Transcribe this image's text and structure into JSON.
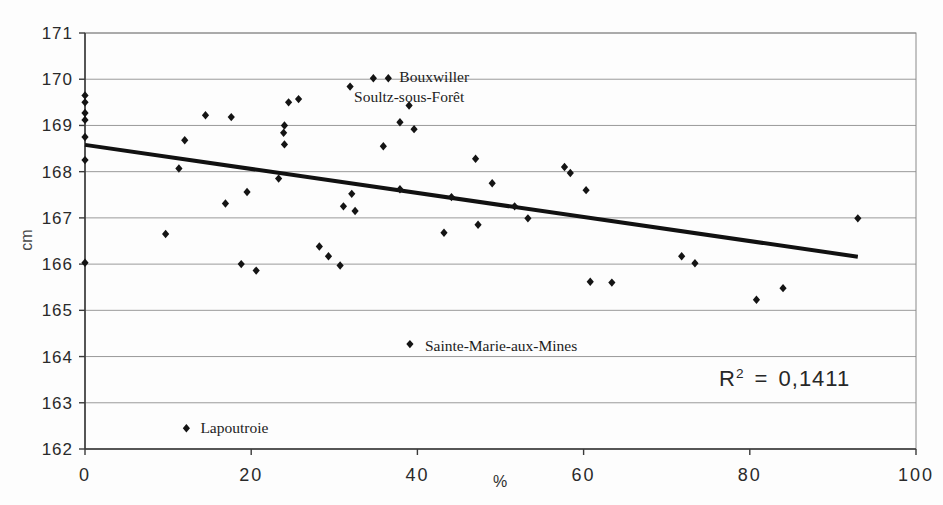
{
  "chart_data": {
    "type": "scatter",
    "title": "",
    "xlabel": "%",
    "ylabel": "cm",
    "xlim": [
      0,
      100
    ],
    "ylim": [
      162,
      171
    ],
    "x_ticks": [
      0,
      20,
      40,
      60,
      80,
      100
    ],
    "y_ticks": [
      162,
      163,
      164,
      165,
      166,
      167,
      168,
      169,
      170,
      171
    ],
    "grid": "horizontal",
    "legend": "none",
    "marker": "diamond",
    "colors": {
      "marker": "#141414",
      "trendline": "#111111",
      "gridline": "#9a9a9a",
      "border": "#8a8a8a",
      "axis": "#3a3a3a",
      "tick_text": "#2a2a2a",
      "annotation_text": "#1c1c1c"
    },
    "points": [
      [
        0,
        169.65
      ],
      [
        0,
        169.5
      ],
      [
        0,
        169.27
      ],
      [
        0,
        169.12
      ],
      [
        0,
        168.75
      ],
      [
        0,
        168.25
      ],
      [
        0,
        166.03
      ],
      [
        9.7,
        166.65
      ],
      [
        11.3,
        168.07
      ],
      [
        12.0,
        168.68
      ],
      [
        12.2,
        162.45
      ],
      [
        14.5,
        169.22
      ],
      [
        16.9,
        167.31
      ],
      [
        17.6,
        169.18
      ],
      [
        18.8,
        166.0
      ],
      [
        19.5,
        167.56
      ],
      [
        20.6,
        165.86
      ],
      [
        23.3,
        167.85
      ],
      [
        23.9,
        168.84
      ],
      [
        24.0,
        169.0
      ],
      [
        24.0,
        168.59
      ],
      [
        24.5,
        169.5
      ],
      [
        25.7,
        169.57
      ],
      [
        28.2,
        166.38
      ],
      [
        29.3,
        166.17
      ],
      [
        30.7,
        165.97
      ],
      [
        31.1,
        167.25
      ],
      [
        31.9,
        169.84
      ],
      [
        32.1,
        167.52
      ],
      [
        32.5,
        167.15
      ],
      [
        34.7,
        170.02
      ],
      [
        35.9,
        168.55
      ],
      [
        36.5,
        170.02
      ],
      [
        37.9,
        169.07
      ],
      [
        37.9,
        167.62
      ],
      [
        39.0,
        169.43
      ],
      [
        39.1,
        164.27
      ],
      [
        39.6,
        168.92
      ],
      [
        43.2,
        166.68
      ],
      [
        44.1,
        167.45
      ],
      [
        47.0,
        168.28
      ],
      [
        47.3,
        166.85
      ],
      [
        49.0,
        167.75
      ],
      [
        51.7,
        167.25
      ],
      [
        53.3,
        166.99
      ],
      [
        57.7,
        168.1
      ],
      [
        58.4,
        167.97
      ],
      [
        60.3,
        167.6
      ],
      [
        60.8,
        165.62
      ],
      [
        63.4,
        165.6
      ],
      [
        71.8,
        166.17
      ],
      [
        73.4,
        166.02
      ],
      [
        80.8,
        165.23
      ],
      [
        84.0,
        165.48
      ],
      [
        93.0,
        166.99
      ]
    ],
    "annotations": [
      {
        "label": "Bouxwiller",
        "x": 36.5,
        "y": 170.02,
        "dx": 11,
        "dy": 4
      },
      {
        "label": "Soultz-sous-Forêt",
        "x": 31.9,
        "y": 169.84,
        "dx": 4,
        "dy": 15
      },
      {
        "label": "Sainte-Marie-aux-Mines",
        "x": 39.1,
        "y": 164.27,
        "dx": 15,
        "dy": 7
      },
      {
        "label": "Lapoutroie",
        "x": 12.2,
        "y": 162.45,
        "dx": 14,
        "dy": 5
      }
    ],
    "trendline": {
      "x1": 0,
      "y1": 168.58,
      "x2": 93.0,
      "y2": 166.16
    },
    "r_squared": {
      "base": "R",
      "sup": "2",
      "rest": " = 0,1411"
    }
  }
}
